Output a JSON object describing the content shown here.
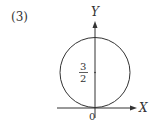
{
  "problem_number": "(3)",
  "axes": {
    "x_label": "X",
    "y_label": "Y",
    "origin_label": "0"
  },
  "circle": {
    "center_label_numerator": "3",
    "center_label_denominator": "2",
    "center": [
      0,
      1.5
    ],
    "radius": 1.5
  },
  "colors": {
    "stroke": "#333333",
    "background": "#ffffff"
  }
}
